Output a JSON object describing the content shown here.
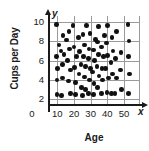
{
  "chart_data": {
    "type": "scatter",
    "title": "",
    "xlabel": "Age",
    "ylabel": "Cups per Day",
    "x_axis_name": "x",
    "y_axis_name": "y",
    "origin_label": "0",
    "xlim": [
      0,
      60
    ],
    "ylim": [
      0,
      11
    ],
    "xticks": [
      10,
      20,
      30,
      40,
      50
    ],
    "yticks": [
      2,
      4,
      6,
      8,
      10
    ],
    "xtick_labels": [
      "10",
      "20",
      "30",
      "40",
      "50"
    ],
    "ytick_labels": [
      "10",
      "8",
      "6",
      "4",
      "2"
    ],
    "grid": true,
    "grid_x": [
      10,
      20,
      30,
      40,
      50
    ],
    "grid_y": [
      2,
      4,
      6,
      8,
      10
    ],
    "legend": null,
    "marker": "filled-circle",
    "marker_color": "#111111",
    "grid_color": "#9a9a9a",
    "axis_color": "#1a1a1a",
    "point_count": 78,
    "points": [
      [
        9.5,
        9.7
      ],
      [
        13.5,
        8.6
      ],
      [
        11.0,
        7.6
      ],
      [
        9.6,
        6.4
      ],
      [
        10.2,
        5.2
      ],
      [
        9.8,
        4.0
      ],
      [
        9.7,
        2.5
      ],
      [
        12.6,
        2.4
      ],
      [
        13.2,
        4.2
      ],
      [
        13.0,
        5.6
      ],
      [
        14.0,
        6.6
      ],
      [
        12.2,
        7.0
      ],
      [
        15.5,
        8.1
      ],
      [
        17.0,
        9.0
      ],
      [
        19.5,
        9.6
      ],
      [
        17.4,
        7.2
      ],
      [
        16.2,
        6.0
      ],
      [
        18.0,
        5.0
      ],
      [
        16.6,
        3.9
      ],
      [
        17.8,
        2.6
      ],
      [
        20.8,
        2.5
      ],
      [
        21.0,
        3.7
      ],
      [
        20.2,
        5.3
      ],
      [
        21.4,
        6.4
      ],
      [
        20.0,
        7.4
      ],
      [
        22.6,
        8.4
      ],
      [
        23.4,
        6.9
      ],
      [
        24.2,
        5.6
      ],
      [
        23.0,
        4.6
      ],
      [
        24.6,
        3.2
      ],
      [
        25.0,
        2.4
      ],
      [
        26.8,
        3.0
      ],
      [
        26.2,
        4.3
      ],
      [
        27.0,
        5.4
      ],
      [
        25.8,
        6.4
      ],
      [
        26.4,
        7.6
      ],
      [
        25.4,
        8.7
      ],
      [
        27.6,
        9.6
      ],
      [
        29.6,
        8.8
      ],
      [
        29.0,
        7.2
      ],
      [
        28.6,
        6.2
      ],
      [
        30.0,
        5.2
      ],
      [
        29.2,
        4.0
      ],
      [
        28.8,
        2.6
      ],
      [
        31.6,
        2.5
      ],
      [
        32.0,
        3.6
      ],
      [
        31.2,
        4.8
      ],
      [
        32.4,
        6.0
      ],
      [
        31.8,
        7.1
      ],
      [
        33.0,
        8.2
      ],
      [
        34.6,
        9.5
      ],
      [
        34.0,
        7.9
      ],
      [
        34.8,
        6.6
      ],
      [
        33.8,
        5.4
      ],
      [
        35.0,
        4.4
      ],
      [
        34.2,
        3.2
      ],
      [
        36.6,
        2.6
      ],
      [
        37.2,
        4.0
      ],
      [
        36.8,
        5.2
      ],
      [
        37.6,
        6.4
      ],
      [
        36.4,
        7.4
      ],
      [
        38.2,
        8.6
      ],
      [
        40.0,
        9.6
      ],
      [
        39.4,
        7.8
      ],
      [
        40.2,
        6.5
      ],
      [
        39.0,
        5.2
      ],
      [
        40.6,
        4.2
      ],
      [
        39.8,
        2.7
      ],
      [
        42.6,
        2.6
      ],
      [
        43.0,
        4.6
      ],
      [
        42.2,
        5.8
      ],
      [
        43.4,
        7.0
      ],
      [
        42.8,
        8.4
      ],
      [
        45.6,
        9.0
      ],
      [
        45.0,
        6.2
      ],
      [
        45.4,
        4.2
      ],
      [
        44.6,
        2.6
      ],
      [
        48.2,
        6.8
      ],
      [
        47.8,
        5.0
      ],
      [
        48.6,
        3.0
      ],
      [
        52.4,
        9.7
      ],
      [
        53.0,
        8.0
      ],
      [
        52.6,
        6.4
      ],
      [
        53.2,
        4.6
      ],
      [
        52.8,
        2.6
      ]
    ]
  }
}
